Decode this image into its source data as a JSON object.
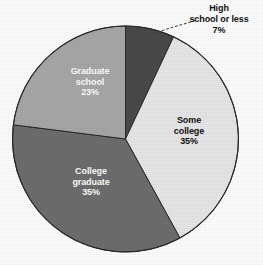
{
  "chart_data": {
    "type": "pie",
    "title": "",
    "subtitle": "",
    "xlabel": "",
    "ylabel": "",
    "legend_position": "none",
    "grid": false,
    "units": "percent",
    "total": 100,
    "start_angle_deg": 0,
    "direction": "clockwise",
    "categories": [
      "High school or less",
      "Some college",
      "College graduate",
      "Graduate school"
    ],
    "values": [
      7,
      35,
      35,
      23
    ],
    "slices": [
      {
        "label_line1": "High",
        "label_line2": "school or less",
        "label": "High school or less",
        "value": 7,
        "value_text": "7%",
        "color": "#4a4a4a",
        "label_placement": "outside",
        "label_text_color": "#111111",
        "leader_line": "dotted"
      },
      {
        "label_line1": "Some",
        "label_line2": "college",
        "label": "Some college",
        "value": 35,
        "value_text": "35%",
        "color": "#e8e8e8",
        "label_placement": "inside",
        "label_text_color": "#111111",
        "leader_line": "none"
      },
      {
        "label_line1": "College",
        "label_line2": "graduate",
        "label": "College graduate",
        "value": 35,
        "value_text": "35%",
        "color": "#6e6e6e",
        "label_placement": "inside",
        "label_text_color": "#ffffff",
        "leader_line": "none"
      },
      {
        "label_line1": "Graduate",
        "label_line2": "school",
        "label": "Graduate school",
        "value": 23,
        "value_text": "23%",
        "color": "#a8a8a8",
        "label_placement": "inside",
        "label_text_color": "#ffffff",
        "leader_line": "none"
      }
    ],
    "outline_color": "#2a2a2a",
    "background_color": "#ffffff"
  }
}
